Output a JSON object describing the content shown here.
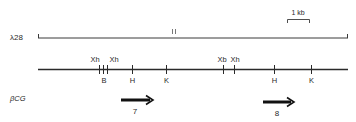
{
  "diagram": {
    "clone_label": "λ28",
    "scale_label": "1 kb",
    "clone_break_mark": "II",
    "map_label": "βCG",
    "sites": [
      {
        "label": "Xh",
        "x": 99,
        "label_pos": "above"
      },
      {
        "label": "B",
        "x": 103,
        "label_pos": "below"
      },
      {
        "label": "Xh",
        "x": 107,
        "label_pos": "above"
      },
      {
        "label": "H",
        "x": 132,
        "label_pos": "below"
      },
      {
        "label": "K",
        "x": 166,
        "label_pos": "below"
      },
      {
        "label": "Xb",
        "x": 223,
        "label_pos": "above"
      },
      {
        "label": "Xh",
        "x": 234,
        "label_pos": "above"
      },
      {
        "label": "H",
        "x": 274,
        "label_pos": "below"
      },
      {
        "label": "K",
        "x": 311,
        "label_pos": "below"
      }
    ],
    "genes": [
      {
        "label": "7",
        "x1": 121,
        "x2": 153
      },
      {
        "label": "8",
        "x1": 263,
        "x2": 294
      }
    ],
    "colors": {
      "ink": "#2a2a2a",
      "background": "#ffffff"
    }
  }
}
